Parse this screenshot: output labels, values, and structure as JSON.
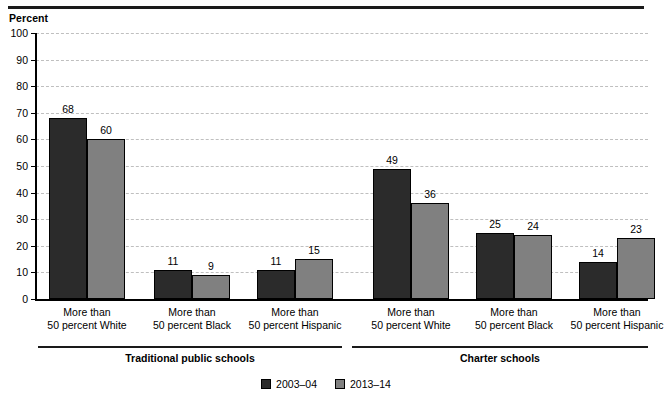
{
  "chart_data": {
    "type": "bar",
    "title": "",
    "ylabel": "Percent",
    "xlabel": "",
    "ylim": [
      0,
      100
    ],
    "yticks": [
      0,
      10,
      20,
      30,
      40,
      50,
      60,
      70,
      80,
      90,
      100
    ],
    "ytick_labels": [
      "0",
      "10",
      "20",
      "30",
      "40",
      "50",
      "60",
      "70",
      "80",
      "90",
      "100"
    ],
    "grid": true,
    "legend_position": "bottom-center",
    "series": [
      {
        "name": "2003–04",
        "color": "#2b2b2b",
        "values": [
          68,
          11,
          11,
          49,
          25,
          14
        ]
      },
      {
        "name": "2013–14",
        "color": "#808080",
        "values": [
          60,
          9,
          15,
          36,
          24,
          23
        ]
      }
    ],
    "categories": [
      "More than\n50 percent White",
      "More than\n50 percent Black",
      "More than\n50 percent Hispanic",
      "More than\n50 percent White",
      "More than\n50 percent Black",
      "More than\n50 percent Hispanic"
    ],
    "category_lines": [
      [
        "More than",
        "50 percent White"
      ],
      [
        "More than",
        "50 percent Black"
      ],
      [
        "More than",
        "50 percent Hispanic"
      ],
      [
        "More than",
        "50 percent White"
      ],
      [
        "More than",
        "50 percent Black"
      ],
      [
        "More than",
        "50 percent Hispanic"
      ]
    ],
    "groups": [
      {
        "label": "Traditional public schools",
        "categories": [
          0,
          1,
          2
        ]
      },
      {
        "label": "Charter schools",
        "categories": [
          3,
          4,
          5
        ]
      }
    ],
    "data_labels": [
      {
        "category": 0,
        "series": 0,
        "value": 68
      },
      {
        "category": 0,
        "series": 1,
        "value": 60
      },
      {
        "category": 1,
        "series": 0,
        "value": 11
      },
      {
        "category": 1,
        "series": 1,
        "value": 9
      },
      {
        "category": 2,
        "series": 0,
        "value": 11
      },
      {
        "category": 2,
        "series": 1,
        "value": 15
      },
      {
        "category": 3,
        "series": 0,
        "value": 49
      },
      {
        "category": 3,
        "series": 1,
        "value": 36
      },
      {
        "category": 4,
        "series": 0,
        "value": 25
      },
      {
        "category": 4,
        "series": 1,
        "value": 24
      },
      {
        "category": 5,
        "series": 0,
        "value": 14
      },
      {
        "category": 5,
        "series": 1,
        "value": 23
      }
    ]
  },
  "legend": {
    "items": [
      {
        "label": "2003–04",
        "color": "#2b2b2b"
      },
      {
        "label": "2013–14",
        "color": "#808080"
      }
    ]
  },
  "colors": {
    "series_2003_04": "#2b2b2b",
    "series_2013_14": "#808080",
    "gridline": "#bfbfbf",
    "axis": "#000000",
    "rule": "#1a1a1a"
  }
}
